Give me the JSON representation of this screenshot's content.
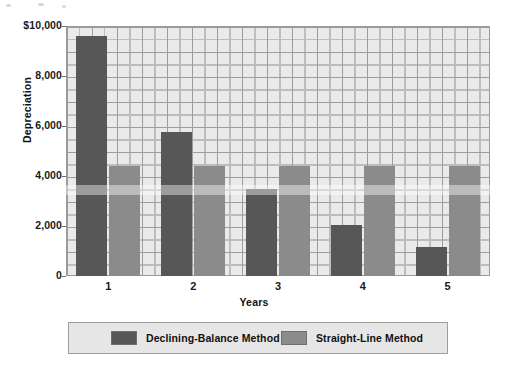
{
  "chart_data": {
    "type": "bar",
    "title": "",
    "xlabel": "Years",
    "ylabel": "Depreciation",
    "categories": [
      "1",
      "2",
      "3",
      "4",
      "5"
    ],
    "ylim": [
      0,
      10000
    ],
    "yticks": [
      0,
      2000,
      4000,
      6000,
      8000,
      10000
    ],
    "ytick_labels": [
      "0",
      "2,000",
      "4,000",
      "6,000",
      "8,000",
      "$10,000"
    ],
    "grid": true,
    "legend_position": "bottom",
    "series": [
      {
        "name": "Declining-Balance Method",
        "color": "#575757",
        "values": [
          9600,
          5760,
          3500,
          2050,
          1150
        ]
      },
      {
        "name": "Straight-Line Method",
        "color": "#8b8b8b",
        "values": [
          4400,
          4400,
          4400,
          4400,
          4400
        ]
      }
    ]
  },
  "legend": {
    "entries": [
      {
        "label": "Declining-Balance Method",
        "swatch": "#575757"
      },
      {
        "label": "Straight-Line Method",
        "swatch": "#8b8b8b"
      }
    ]
  },
  "axes": {
    "y_title": "Depreciation",
    "x_title": "Years"
  }
}
